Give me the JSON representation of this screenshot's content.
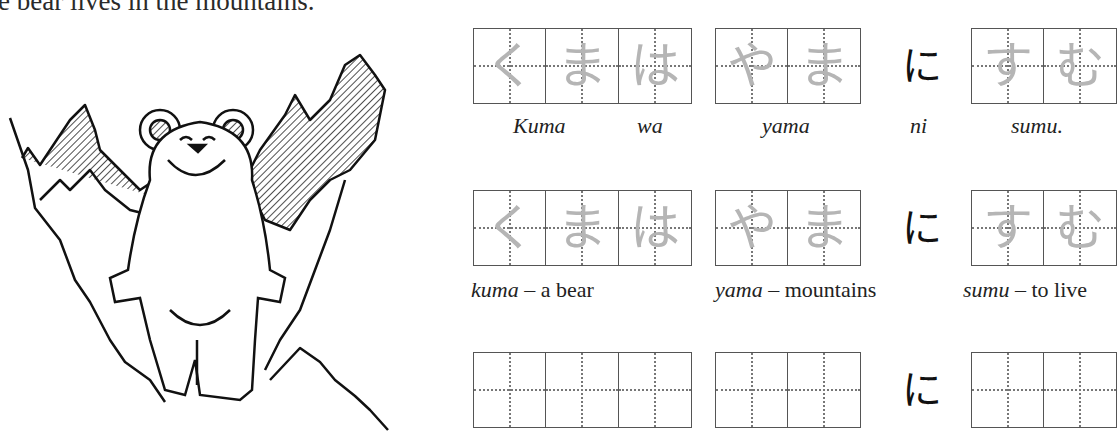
{
  "title": "e bear lives in the mountains.",
  "illustration": {
    "description": "bear standing in front of mountains"
  },
  "rows": [
    {
      "groups": [
        {
          "chars": [
            "く",
            "ま",
            "は"
          ]
        },
        {
          "chars": [
            "や",
            "ま"
          ]
        },
        {
          "chars": [
            "す",
            "む"
          ]
        }
      ],
      "particle": "に",
      "labels": [
        "Kuma",
        "wa",
        "yama",
        "ni",
        "sumu."
      ]
    },
    {
      "groups": [
        {
          "chars": [
            "く",
            "ま",
            "は"
          ]
        },
        {
          "chars": [
            "や",
            "ま"
          ]
        },
        {
          "chars": [
            "す",
            "む"
          ]
        }
      ],
      "particle": "に",
      "glossary": [
        {
          "term": "kuma",
          "meaning": " – a bear"
        },
        {
          "term": "yama",
          "meaning": " – mountains"
        },
        {
          "term": "sumu",
          "meaning": " – to live"
        }
      ]
    },
    {
      "groups": [
        {
          "chars": [
            "",
            "",
            ""
          ]
        },
        {
          "chars": [
            "",
            ""
          ]
        },
        {
          "chars": [
            "",
            ""
          ]
        }
      ],
      "particle": "に"
    }
  ],
  "colors": {
    "trace": "#b5b5b5",
    "grid": "#555555",
    "ink": "#111111"
  }
}
